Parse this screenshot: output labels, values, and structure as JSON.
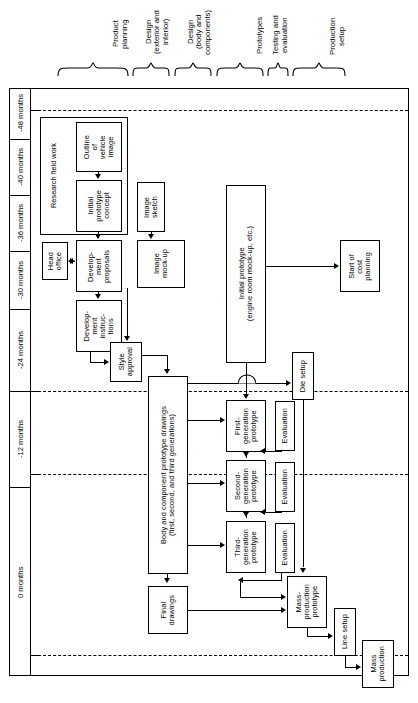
{
  "figure": {
    "orientation": "rotated-90",
    "time_axis_label": "months"
  },
  "phases": [
    {
      "id": "product-planning",
      "label": "Product\nplanning"
    },
    {
      "id": "design-ext-int",
      "label": "Design\n(exterior and\ninterior)"
    },
    {
      "id": "design-body-comp",
      "label": "Design\n(body and\ncomponents)"
    },
    {
      "id": "prototypes",
      "label": "Prototypes"
    },
    {
      "id": "testing-eval",
      "label": "Testing and\nevaluation"
    },
    {
      "id": "production-setup",
      "label": "Production\nsetup"
    }
  ],
  "time_axis": [
    {
      "id": "t-48",
      "label": "-48 months"
    },
    {
      "id": "t-40",
      "label": "-40 months"
    },
    {
      "id": "t-36",
      "label": "-36 months"
    },
    {
      "id": "t-30",
      "label": "-30 months"
    },
    {
      "id": "t-24",
      "label": "-24 months"
    },
    {
      "id": "t-12",
      "label": "-12 months"
    },
    {
      "id": "t-0",
      "label": "0 months"
    }
  ],
  "groups": [
    {
      "id": "research-field-work",
      "label": "Research field work"
    }
  ],
  "nodes": [
    {
      "id": "outline-vehicle-image",
      "label": "Outline\nof\nvehicle\nimage"
    },
    {
      "id": "initial-prototype-concept",
      "label": "Initial\nprototype\nconcept"
    },
    {
      "id": "image-sketch",
      "label": "Image\nsketch"
    },
    {
      "id": "head-office",
      "label": "Head\noffice"
    },
    {
      "id": "development-proposals",
      "label": "Develop-\nment\nproposals"
    },
    {
      "id": "image-mock-up",
      "label": "Image\nmock-up"
    },
    {
      "id": "development-instructions",
      "label": "Develop-\nment\ninstruc-\ntions"
    },
    {
      "id": "initial-prototype",
      "label": "Initial prototype\n(engine room mock-up, etc.)"
    },
    {
      "id": "start-of-cost-planning",
      "label": "Start of\ncost\nplanning"
    },
    {
      "id": "style-approval",
      "label": "Style\napproval"
    },
    {
      "id": "body-component-drawings",
      "label": "Body and component prototype drawings\n(first, second, and third generations)"
    },
    {
      "id": "die-setup",
      "label": "Die setup"
    },
    {
      "id": "first-generation-prototype",
      "label": "First-\ngeneration\nprototype"
    },
    {
      "id": "evaluation-1",
      "label": "Evaluation"
    },
    {
      "id": "second-generation-prototype",
      "label": "Second-\ngeneration\nprototype"
    },
    {
      "id": "evaluation-2",
      "label": "Evaluation"
    },
    {
      "id": "third-generation-prototype",
      "label": "Third-\ngeneration\nprototype"
    },
    {
      "id": "evaluation-3",
      "label": "Evaluation"
    },
    {
      "id": "final-drawings",
      "label": "Final\ndrawings"
    },
    {
      "id": "mass-production-prototype",
      "label": "Mass-\nproduction\nprototype"
    },
    {
      "id": "line-setup",
      "label": "Line setup"
    },
    {
      "id": "mass-production",
      "label": "Mass\nproduction"
    }
  ],
  "colors": {
    "stroke": "#000000",
    "background": "#ffffff"
  }
}
